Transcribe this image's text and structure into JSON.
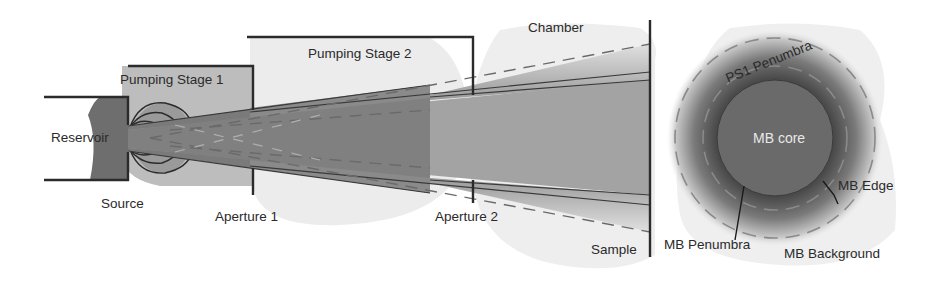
{
  "diagram": {
    "type": "molecular-beam-apparatus-schematic",
    "labels": {
      "reservoir": "Reservoir",
      "source": "Source",
      "pumping_stage_1": "Pumping Stage 1",
      "pumping_stage_2": "Pumping Stage 2",
      "aperture_1": "Aperture 1",
      "aperture_2": "Aperture 2",
      "chamber": "Chamber",
      "sample": "Sample"
    },
    "spot_profile": {
      "ps1_penumbra": "PS1 Penumbra",
      "mb_core": "MB core",
      "mb_edge": "MB Edge",
      "mb_penumbra": "MB Penumbra",
      "mb_background": "MB Background"
    },
    "colors": {
      "line": "#2b2b2b",
      "reservoir_fill": "#6e6e6e",
      "stage1_fill": "#bdbdbd",
      "stage2_fill": "#ececec",
      "chamber_fill": "#eeeeee",
      "beam_outer": "#7a7a7a",
      "beam_inner": "#909090",
      "beam_core": "#a8a8a8",
      "dashes": "#8a8a8a",
      "mb_core_fill": "#6a6a6a"
    }
  }
}
